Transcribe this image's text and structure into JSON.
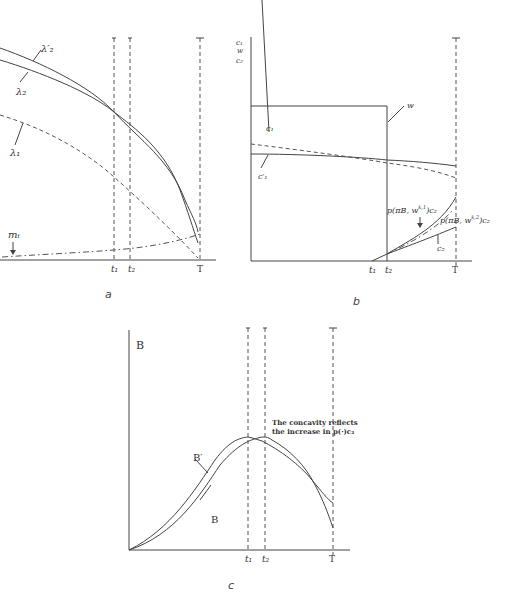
{
  "panels": {
    "a": {
      "caption": "a",
      "curves": {
        "lambda2_prime": "λ′₂",
        "lambda2": "λ₂",
        "lambda1": "λ₁",
        "m": "mₜ"
      },
      "ticks": {
        "t1": "t₁",
        "t2": "t₂",
        "T": "T"
      }
    },
    "b": {
      "caption": "b",
      "y_labels": [
        "c₁",
        "w",
        "c₂"
      ],
      "curves": {
        "w": "w",
        "c1": "c₁",
        "c1_prime": "c′₁",
        "c2": "c₂",
        "p1": "p(πB, w^{k,1})c₂",
        "p2": "p(πB, w^{k,2})c₂"
      },
      "p1_main": "p(πB, w",
      "p1_sup": "k,1",
      "p1_tail": ")c₂",
      "p2_main": "p(πB, w",
      "p2_sup": "k,2",
      "p2_tail": ")c₂",
      "ticks": {
        "t1": "t₁",
        "t2": "t₂",
        "T": "T"
      }
    },
    "c": {
      "caption": "c",
      "y_label": "B",
      "curves": {
        "B_prime": "B′",
        "B": "B"
      },
      "annotation_line1": "The concavity reflects",
      "annotation_line2": "the increase in p(·)c₂",
      "ticks": {
        "t1": "t₁",
        "t2": "t₂",
        "T": "T"
      }
    }
  }
}
